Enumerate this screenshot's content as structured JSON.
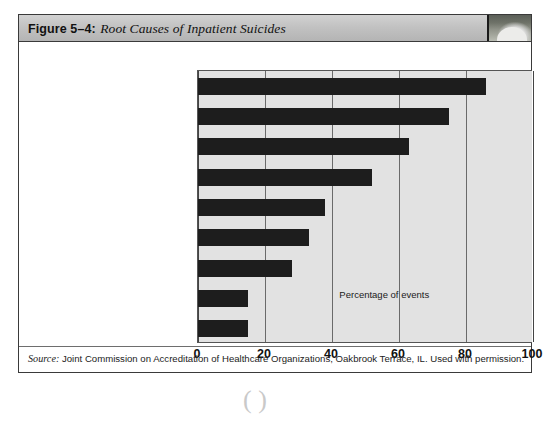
{
  "figure": {
    "number_label": "Figure 5–4:",
    "title": "Root Causes of Inpatient Suicides",
    "thumbnail_name": "figure-thumbnail"
  },
  "source": {
    "prefix": "Source:",
    "text": " Joint Commission on Accreditation of Healthcare Organizations, Oakbrook Terrace, IL. Used with permission."
  },
  "chart_data": {
    "type": "bar",
    "orientation": "horizontal",
    "title": "Root Causes of Inpatient Suicides",
    "xlabel": "Percentage of events",
    "ylabel": "",
    "xlim": [
      0,
      100
    ],
    "xticks": [
      "0",
      "20",
      "40",
      "60",
      "80",
      "100"
    ],
    "xtick_values": [
      0,
      20,
      40,
      60,
      80,
      100
    ],
    "grid": true,
    "legend": null,
    "bar_color": "#1d1d1d",
    "plot_background": "#e2e2e2",
    "categories": [
      "Physical environment",
      "Patient assessment",
      "Orientation/training",
      "Pt. observation P&Ps",
      "Communication",
      "Care planning",
      "Information availability",
      "Competency/credentialing",
      "Staffing levels"
    ],
    "values": [
      86,
      75,
      63,
      52,
      38,
      33,
      28,
      15,
      15
    ]
  }
}
